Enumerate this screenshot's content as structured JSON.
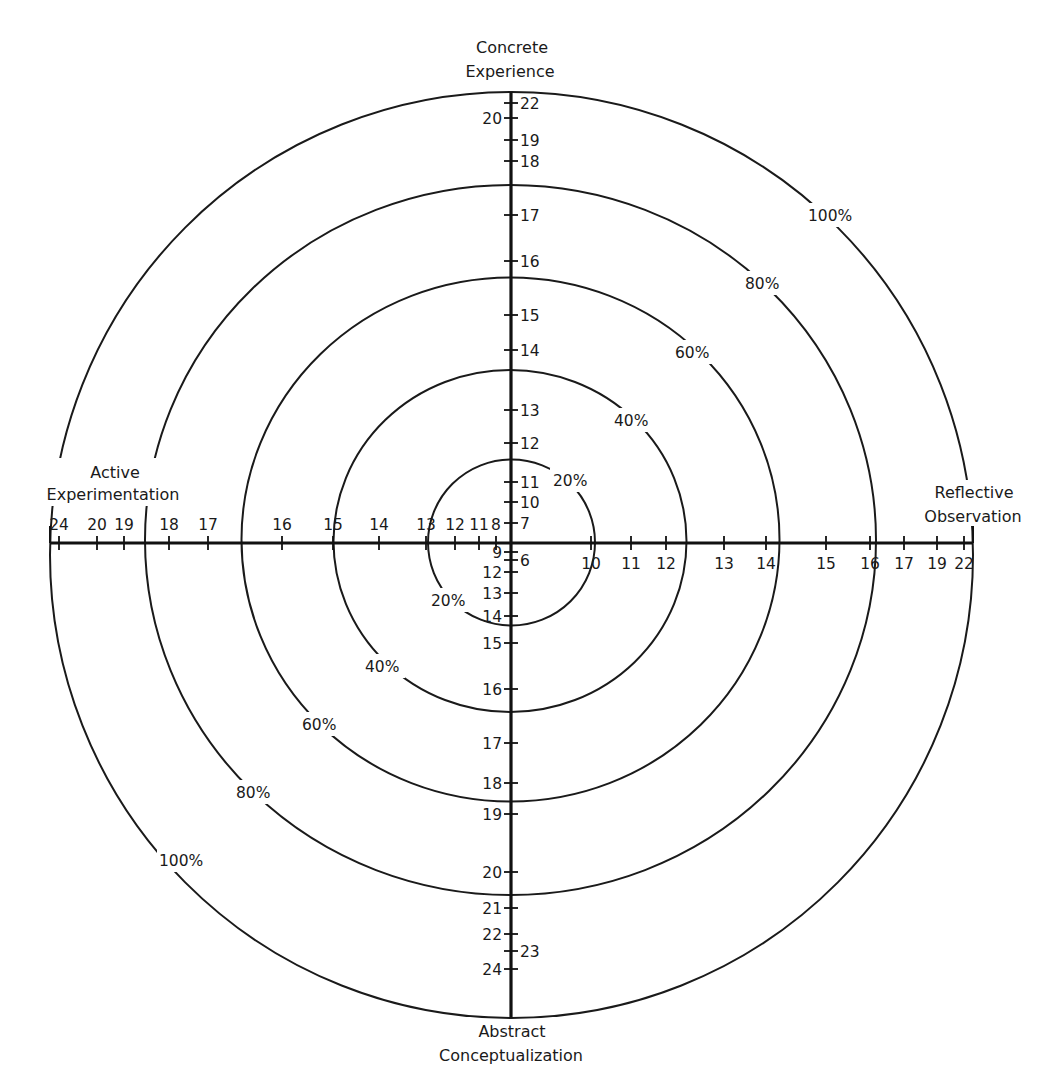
{
  "chart_data": {
    "type": "radar-grid",
    "title": "",
    "poles": {
      "top": [
        "Concrete",
        "Experience"
      ],
      "bottom": [
        "Abstract",
        "Conceptualization"
      ],
      "left": [
        "Active",
        "Experimentation"
      ],
      "right": [
        "Reflective",
        "Observation"
      ]
    },
    "rings": [
      {
        "label": "20%",
        "percent": 20
      },
      {
        "label": "40%",
        "percent": 40
      },
      {
        "label": "60%",
        "percent": 60
      },
      {
        "label": "80%",
        "percent": 80
      },
      {
        "label": "100%",
        "percent": 100
      }
    ],
    "axes": {
      "top_concrete_experience": {
        "side_right": [
          "22",
          "19",
          "18",
          "17",
          "16",
          "15",
          "14",
          "13",
          "12",
          "11",
          "10",
          "7"
        ],
        "side_left": [
          "20"
        ]
      },
      "bottom_abstract_conceptualization": {
        "side_right": [
          "6",
          "23"
        ],
        "side_left": [
          "9",
          "12",
          "13",
          "14",
          "15",
          "16",
          "17",
          "18",
          "19",
          "20",
          "21",
          "22",
          "24"
        ]
      },
      "left_active_experimentation": [
        "24",
        "20",
        "19",
        "18",
        "17",
        "16",
        "15",
        "14",
        "13",
        "12",
        "11",
        "8"
      ],
      "right_reflective_observation": [
        "10",
        "11",
        "12",
        "13",
        "14",
        "15",
        "16",
        "17",
        "19",
        "22"
      ]
    },
    "grid": false,
    "legend": null
  },
  "labels": {
    "top_line1": "Concrete",
    "top_line2": "Experience",
    "bottom_line1": "Abstract",
    "bottom_line2": "Conceptualization",
    "left_line1": "Active",
    "left_line2": "Experimentation",
    "right_line1": "Reflective",
    "right_line2": "Observation",
    "pct20": "20%",
    "pct40": "40%",
    "pct60": "60%",
    "pct80": "80%",
    "pct100": "100%"
  },
  "ticks": {
    "top": [
      {
        "v": "22",
        "y": 103,
        "side": "r"
      },
      {
        "v": "20",
        "y": 118,
        "side": "l"
      },
      {
        "v": "19",
        "y": 140,
        "side": "r"
      },
      {
        "v": "18",
        "y": 161,
        "side": "r"
      },
      {
        "v": "17",
        "y": 215,
        "side": "r"
      },
      {
        "v": "16",
        "y": 261,
        "side": "r"
      },
      {
        "v": "15",
        "y": 315,
        "side": "r"
      },
      {
        "v": "14",
        "y": 350,
        "side": "r"
      },
      {
        "v": "13",
        "y": 410,
        "side": "r"
      },
      {
        "v": "12",
        "y": 443,
        "side": "r"
      },
      {
        "v": "11",
        "y": 482,
        "side": "r"
      },
      {
        "v": "10",
        "y": 502,
        "side": "r"
      },
      {
        "v": "7",
        "y": 523,
        "side": "r"
      }
    ],
    "bottom": [
      {
        "v": "9",
        "y": 552,
        "side": "l"
      },
      {
        "v": "6",
        "y": 560,
        "side": "r"
      },
      {
        "v": "12",
        "y": 572,
        "side": "l"
      },
      {
        "v": "13",
        "y": 593,
        "side": "l"
      },
      {
        "v": "14",
        "y": 616,
        "side": "l"
      },
      {
        "v": "15",
        "y": 643,
        "side": "l"
      },
      {
        "v": "16",
        "y": 689,
        "side": "l"
      },
      {
        "v": "17",
        "y": 743,
        "side": "l"
      },
      {
        "v": "18",
        "y": 783,
        "side": "l"
      },
      {
        "v": "19",
        "y": 814,
        "side": "l"
      },
      {
        "v": "20",
        "y": 872,
        "side": "l"
      },
      {
        "v": "21",
        "y": 908,
        "side": "l"
      },
      {
        "v": "22",
        "y": 934,
        "side": "l"
      },
      {
        "v": "23",
        "y": 951,
        "side": "r"
      },
      {
        "v": "24",
        "y": 969,
        "side": "l"
      }
    ],
    "left": [
      {
        "v": "24",
        "x": 59
      },
      {
        "v": "20",
        "x": 97
      },
      {
        "v": "19",
        "x": 124
      },
      {
        "v": "18",
        "x": 169
      },
      {
        "v": "17",
        "x": 208
      },
      {
        "v": "16",
        "x": 282
      },
      {
        "v": "15",
        "x": 333
      },
      {
        "v": "14",
        "x": 379
      },
      {
        "v": "13",
        "x": 426
      },
      {
        "v": "12",
        "x": 455
      },
      {
        "v": "11",
        "x": 479
      },
      {
        "v": "8",
        "x": 496
      }
    ],
    "right": [
      {
        "v": "10",
        "x": 591
      },
      {
        "v": "11",
        "x": 631
      },
      {
        "v": "12",
        "x": 666
      },
      {
        "v": "13",
        "x": 724
      },
      {
        "v": "14",
        "x": 766
      },
      {
        "v": "15",
        "x": 826
      },
      {
        "v": "16",
        "x": 870
      },
      {
        "v": "17",
        "x": 904
      },
      {
        "v": "19",
        "x": 937
      },
      {
        "v": "22",
        "x": 964
      }
    ]
  }
}
